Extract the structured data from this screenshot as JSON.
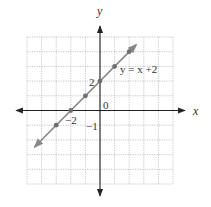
{
  "chart_data": {
    "type": "line",
    "title": "",
    "xlabel": "x",
    "ylabel": "y",
    "xlim": [
      -5,
      5
    ],
    "ylim": [
      -5,
      5
    ],
    "grid": true,
    "grid_style": "dotted",
    "series": [
      {
        "name": "y = x + 2",
        "equation": "y = x + 2",
        "slope": 1,
        "intercept": 2,
        "line_extent": [
          [
            -4.5,
            -2.5
          ],
          [
            2.5,
            4.5
          ]
        ],
        "points": [
          {
            "x": -3,
            "y": -1
          },
          {
            "x": -2,
            "y": 0
          },
          {
            "x": -1,
            "y": 1
          },
          {
            "x": 0,
            "y": 2
          },
          {
            "x": 1,
            "y": 3
          },
          {
            "x": 2,
            "y": 4
          }
        ]
      }
    ],
    "annotations": [
      {
        "text": "y = x +2",
        "x": 1.3,
        "y": 2.9
      },
      {
        "text": "2",
        "x": -0.45,
        "y": 1.95
      },
      {
        "text": "0",
        "x": 0.2,
        "y": 0.35
      },
      {
        "text": "−2",
        "x": -1.9,
        "y": -0.45
      },
      {
        "text": "−1",
        "x": -0.7,
        "y": -0.95
      }
    ]
  },
  "labels": {
    "x_axis": "x",
    "y_axis": "y",
    "equation": "y = x +2",
    "tick_2": "2",
    "origin": "0",
    "tick_neg2": "−2",
    "tick_neg1": "−1"
  },
  "colors": {
    "grid": "#b8b8b8",
    "grid_border": "#c8c8c8",
    "axis": "#222222",
    "line": "#888888",
    "point": "#6e6e6e",
    "text": "#333333"
  }
}
